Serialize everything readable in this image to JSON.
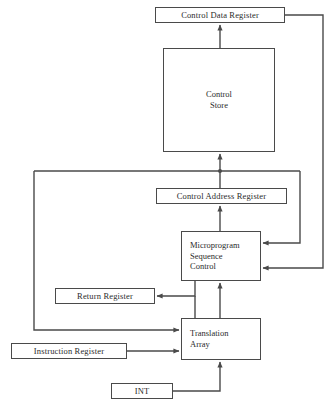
{
  "diagram": {
    "stroke_color": "#4a4a4a",
    "text_color": "#2b2b2b",
    "background_color": "#ffffff",
    "nodes": [
      {
        "id": "control_data_register",
        "label": "Control Data Register"
      },
      {
        "id": "control_store",
        "label": "Control\nStore"
      },
      {
        "id": "control_address_register",
        "label": "Control Address Register"
      },
      {
        "id": "microprogram_sequence_control",
        "label": "Microprogram\nSequence\nControl"
      },
      {
        "id": "return_register",
        "label": "Return Register"
      },
      {
        "id": "translation_array",
        "label": "Translation\nArray"
      },
      {
        "id": "instruction_register",
        "label": "Instruction Register"
      },
      {
        "id": "int",
        "label": "INT"
      }
    ],
    "edges": [
      {
        "from": "control_store",
        "to": "control_data_register",
        "label": ""
      },
      {
        "from": "control_data_register",
        "to": "microprogram_sequence_control",
        "label": ""
      },
      {
        "from": "control_address_register",
        "to": "control_store",
        "label": ""
      },
      {
        "from": "microprogram_sequence_control",
        "to": "control_address_register",
        "label": ""
      },
      {
        "from": "microprogram_sequence_control",
        "to": "return_register",
        "label": ""
      },
      {
        "from": "return_register",
        "to": "microprogram_sequence_control",
        "label": ""
      },
      {
        "from": "translation_array",
        "to": "microprogram_sequence_control",
        "label": ""
      },
      {
        "from": "translation_array",
        "to": "control_store",
        "label": ""
      },
      {
        "from": "instruction_register",
        "to": "translation_array",
        "label": ""
      },
      {
        "from": "int",
        "to": "translation_array",
        "label": ""
      }
    ]
  }
}
